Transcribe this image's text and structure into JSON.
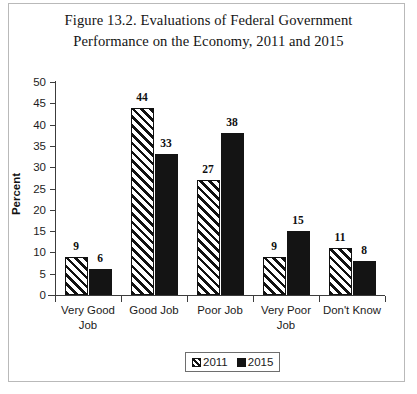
{
  "chart_data": {
    "type": "bar",
    "title": "Figure 13.2. Evaluations of Federal Government Performance on the Economy, 2011 and 2015",
    "title_lines": [
      "Figure 13.2. Evaluations of Federal Government",
      "Performance on the Economy, 2011 and 2015"
    ],
    "xlabel": "",
    "ylabel": "Percent",
    "ylim": [
      0,
      50
    ],
    "ytick_step": 5,
    "yticks": [
      50,
      45,
      40,
      35,
      30,
      25,
      20,
      15,
      10,
      5,
      0
    ],
    "grid": false,
    "legend_position": "bottom",
    "categories": [
      "Very Good Job",
      "Good Job",
      "Poor Job",
      "Very Poor Job",
      "Don't Know"
    ],
    "category_lines": [
      [
        "Very Good",
        "Job"
      ],
      [
        "Good Job"
      ],
      [
        "Poor Job"
      ],
      [
        "Very Poor",
        "Job"
      ],
      [
        "Don't Know"
      ]
    ],
    "series": [
      {
        "name": "2011",
        "fill": "diagonal-hatch",
        "color": "#111111",
        "values": [
          9,
          44,
          27,
          9,
          11
        ]
      },
      {
        "name": "2015",
        "fill": "solid",
        "color": "#141414",
        "values": [
          6,
          33,
          38,
          15,
          8
        ]
      }
    ]
  },
  "figure": {
    "border_color": "#b9b9b9",
    "background": "#ffffff",
    "axis_color": "#3c3c3c"
  }
}
